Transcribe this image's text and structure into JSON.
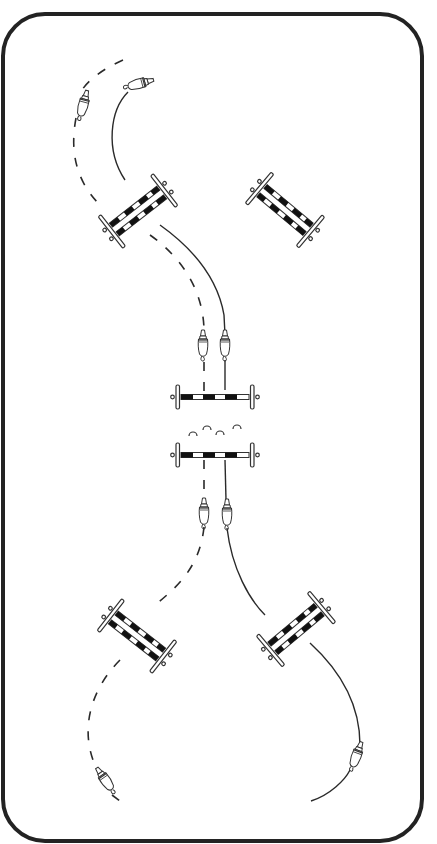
{
  "diagram": {
    "arena": {
      "x": 3,
      "y": 14,
      "width": 419,
      "height": 827,
      "corner_radius": 42,
      "border_color": "#232323"
    },
    "colors": {
      "line": "#2a2a2a",
      "pole_dark": "#111111",
      "pole_light": "#ffffff",
      "background": "#ffffff"
    },
    "legend": {
      "solid_line": "Rider 1 track (solid)",
      "dashed_line": "Rider 2 track (dashed)"
    },
    "jumps": [
      {
        "id": "oxer-upper-left",
        "type": "oxer",
        "cx": 138,
        "cy": 211,
        "angle": -38
      },
      {
        "id": "oxer-upper-right",
        "type": "oxer",
        "cx": 285,
        "cy": 210,
        "angle": 40
      },
      {
        "id": "vertical-upper",
        "type": "vertical",
        "cx": 215,
        "cy": 397,
        "angle": 0
      },
      {
        "id": "vertical-lower",
        "type": "vertical",
        "cx": 215,
        "cy": 455,
        "angle": 0
      },
      {
        "id": "oxer-lower-left",
        "type": "oxer",
        "cx": 137,
        "cy": 636,
        "angle": 38
      },
      {
        "id": "oxer-lower-right",
        "type": "oxer",
        "cx": 296,
        "cy": 629,
        "angle": -40
      }
    ],
    "horseshoe_markers": [
      {
        "cx": 193,
        "cy": 432
      },
      {
        "cx": 207,
        "cy": 426
      },
      {
        "cx": 220,
        "cy": 431
      },
      {
        "cx": 237,
        "cy": 425
      }
    ],
    "riders": [
      {
        "id": "rider-top-solid",
        "track": "solid",
        "x": 135,
        "y": 85,
        "angle": 75
      },
      {
        "id": "rider-top-dashed",
        "track": "dashed",
        "x": 84,
        "y": 105,
        "angle": 15
      },
      {
        "id": "rider-mid-dashed",
        "track": "dashed",
        "x": 203,
        "y": 350,
        "angle": 0
      },
      {
        "id": "rider-mid-solid",
        "track": "solid",
        "x": 225,
        "y": 350,
        "angle": 0
      },
      {
        "id": "rider-low-dashed",
        "track": "dashed",
        "x": 204,
        "y": 512,
        "angle": 0
      },
      {
        "id": "rider-low-solid",
        "track": "solid",
        "x": 227,
        "y": 514,
        "angle": 0
      },
      {
        "id": "rider-bottom-dashed",
        "track": "dashed",
        "x": 107,
        "y": 783,
        "angle": -35
      },
      {
        "id": "rider-bottom-solid",
        "track": "solid",
        "x": 355,
        "y": 757,
        "angle": 20
      }
    ]
  }
}
